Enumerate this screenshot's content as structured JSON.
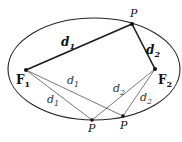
{
  "diagram": {
    "colors": {
      "ellipse": "#222222",
      "bold_segment": "#1a1a1a",
      "light_segment": "#555555",
      "point": "#111111"
    },
    "labels": {
      "top_point": "P",
      "bottom_point_1": "P",
      "bottom_point_2": "P",
      "focus_1": "F",
      "focus_1_sub": "1",
      "focus_2": "F",
      "focus_2_sub": "2",
      "bold_d1": "d",
      "bold_d1_sub": "1",
      "bold_d2": "d",
      "bold_d2_sub": "2",
      "light_d1_a": "d",
      "light_d1_a_sub": "1",
      "light_d1_b": "d",
      "light_d1_b_sub": "1",
      "light_d2_a": "d",
      "light_d2_a_sub": "2",
      "light_d2_b": "d",
      "light_d2_b_sub": "2"
    }
  }
}
